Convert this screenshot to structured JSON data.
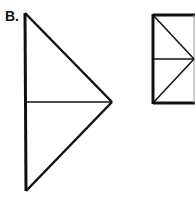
{
  "option_label": "B.",
  "colors": {
    "stroke": "#111111",
    "background": "#ffffff"
  },
  "figures": [
    {
      "name": "triangle",
      "description": "Right-pointing triangle with vertical left side, divided by a horizontal median line",
      "vertices": [
        [
          25,
          13
        ],
        [
          112,
          102
        ],
        [
          26,
          191
        ]
      ],
      "inner_lines": [
        [
          [
            25,
            102
          ],
          [
            112,
            102
          ]
        ]
      ]
    },
    {
      "name": "rectangle",
      "description": "Tall rectangle divided by a horizontal midline with two diagonals meeting at right-mid point",
      "rect": {
        "x": 153,
        "y": 15,
        "w": 41,
        "h": 88
      },
      "inner_lines": [
        [
          [
            153,
            59
          ],
          [
            194,
            59
          ]
        ],
        [
          [
            153,
            15
          ],
          [
            194,
            59
          ]
        ],
        [
          [
            153,
            103
          ],
          [
            194,
            59
          ]
        ]
      ]
    }
  ]
}
